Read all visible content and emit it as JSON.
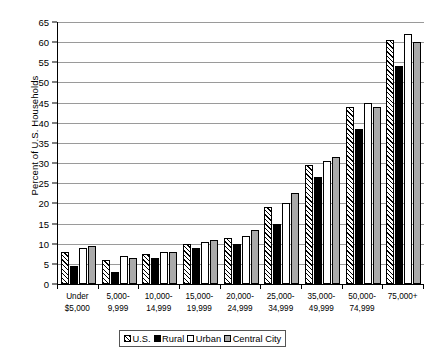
{
  "chart_data": {
    "type": "bar",
    "title": "",
    "xlabel": "",
    "ylabel": "Percent of U.S. Households",
    "ylim": [
      0,
      65
    ],
    "ytick_step": 5,
    "yticks": [
      0,
      5,
      10,
      15,
      20,
      25,
      30,
      35,
      40,
      45,
      50,
      55,
      60,
      65
    ],
    "grid": true,
    "legend_position": "bottom",
    "categories": [
      "Under\n$5,000",
      "5,000-\n9,999",
      "10,000-\n14,999",
      "15,000-\n19,999",
      "20,000-\n24,999",
      "25,000-\n34,999",
      "35,000-\n49,999",
      "50,000-\n74,999",
      "75,000+"
    ],
    "series": [
      {
        "name": "U.S.",
        "pattern": "diagonal-hatch",
        "color": "#ffffff",
        "values": [
          8,
          6,
          7.5,
          10,
          11.5,
          19,
          29.5,
          44,
          60.5
        ]
      },
      {
        "name": "Rural",
        "pattern": "solid",
        "color": "#000000",
        "values": [
          4.5,
          3,
          6.5,
          9,
          10,
          15,
          26.5,
          38.5,
          54
        ]
      },
      {
        "name": "Urban",
        "pattern": "solid",
        "color": "#ffffff",
        "values": [
          9,
          7,
          8,
          10.5,
          12,
          20,
          30.5,
          45,
          62
        ]
      },
      {
        "name": "Central City",
        "pattern": "solid",
        "color": "#aaaaaa",
        "values": [
          9.5,
          6.5,
          8,
          11,
          13.5,
          22.5,
          31.5,
          44,
          60
        ]
      }
    ]
  },
  "legend": {
    "items": [
      {
        "label": "U.S."
      },
      {
        "label": "Rural"
      },
      {
        "label": "Urban"
      },
      {
        "label": "Central City"
      }
    ]
  }
}
